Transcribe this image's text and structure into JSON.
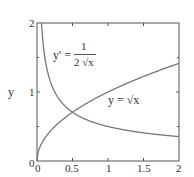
{
  "chart_data": {
    "type": "line",
    "title": "",
    "xlabel": "",
    "ylabel": "y",
    "xlim": [
      0,
      2
    ],
    "ylim": [
      0,
      2
    ],
    "x_ticks": [
      "0",
      "0.5",
      "1",
      "1.5",
      "2"
    ],
    "y_ticks": [
      "0",
      "1",
      "2"
    ],
    "grid": false,
    "series": [
      {
        "name": "y = √x",
        "function": "sqrt(x)",
        "x": [
          0,
          0.25,
          0.5,
          1,
          1.5,
          2
        ],
        "values": [
          0,
          0.5,
          0.707,
          1,
          1.225,
          1.414
        ]
      },
      {
        "name": "y' = 1/(2√x)",
        "function": "1/(2*sqrt(x))",
        "x": [
          0.0625,
          0.25,
          0.5,
          1,
          1.5,
          2
        ],
        "values": [
          2,
          1,
          0.707,
          0.5,
          0.408,
          0.354
        ]
      }
    ],
    "annotations": [
      {
        "text": "y' = 1 / (2√x)",
        "position": "upper-left"
      },
      {
        "text": "y = √x",
        "position": "center-right"
      }
    ]
  },
  "labels": {
    "ylabel": "y",
    "xtick0": "0",
    "xtick1": "0.5",
    "xtick2": "1",
    "xtick3": "1.5",
    "xtick4": "2",
    "ytick0": "0",
    "ytick1": "1",
    "ytick2": "2",
    "deriv_lhs": "y' =",
    "deriv_num": "1",
    "deriv_den": "2 √x",
    "sqrt_lbl": "y = √x"
  }
}
